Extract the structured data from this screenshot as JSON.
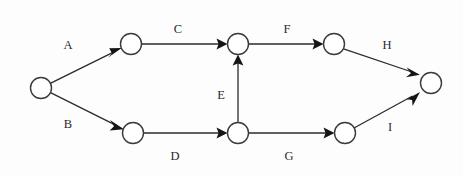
{
  "diagram": {
    "type": "directed-graph",
    "canvas": {
      "width": 463,
      "height": 176
    },
    "colors": {
      "background": "#fdfdfd",
      "node_stroke": "#3a3a3a",
      "node_fill": "#ffffff",
      "edge": "#2b2b2b",
      "arrow": "#151515",
      "label": "#2a2a2a"
    },
    "nodes": [
      {
        "id": "n1",
        "label": "",
        "cx": 41,
        "cy": 88,
        "r": 10.5
      },
      {
        "id": "n2",
        "label": "",
        "cx": 131,
        "cy": 44,
        "r": 10.5
      },
      {
        "id": "n3",
        "label": "",
        "cx": 238,
        "cy": 44,
        "r": 10.5
      },
      {
        "id": "n4",
        "label": "",
        "cx": 334,
        "cy": 44,
        "r": 10.5
      },
      {
        "id": "n5",
        "label": "",
        "cx": 431,
        "cy": 83,
        "r": 10.5
      },
      {
        "id": "n6",
        "label": "",
        "cx": 133,
        "cy": 133,
        "r": 10.5
      },
      {
        "id": "n7",
        "label": "",
        "cx": 238,
        "cy": 133,
        "r": 10.5
      },
      {
        "id": "n8",
        "label": "",
        "cx": 345,
        "cy": 133,
        "r": 10.5
      }
    ],
    "edges": [
      {
        "id": "e-A",
        "label": "A",
        "from": "n1",
        "to": "n2",
        "label_x": 68,
        "label_y": 46
      },
      {
        "id": "e-B",
        "label": "B",
        "from": "n1",
        "to": "n6",
        "label_x": 68,
        "label_y": 125
      },
      {
        "id": "e-C",
        "label": "C",
        "from": "n2",
        "to": "n3",
        "label_x": 178,
        "label_y": 30
      },
      {
        "id": "e-D",
        "label": "D",
        "from": "n6",
        "to": "n7",
        "label_x": 175,
        "label_y": 157
      },
      {
        "id": "e-E",
        "label": "E",
        "from": "n7",
        "to": "n3",
        "label_x": 221,
        "label_y": 96
      },
      {
        "id": "e-F",
        "label": "F",
        "from": "n3",
        "to": "n4",
        "label_x": 287,
        "label_y": 30
      },
      {
        "id": "e-G",
        "label": "G",
        "from": "n7",
        "to": "n8",
        "label_x": 289,
        "label_y": 157
      },
      {
        "id": "e-H",
        "label": "H",
        "from": "n4",
        "to": "n5",
        "label_x": 387,
        "label_y": 46
      },
      {
        "id": "e-I",
        "label": "I",
        "from": "n8",
        "to": "n5",
        "label_x": 390,
        "label_y": 128
      }
    ]
  }
}
